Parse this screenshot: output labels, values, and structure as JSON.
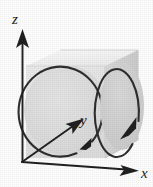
{
  "figure": {
    "title": "",
    "caption": "",
    "background_color": "#fefefe",
    "axes": {
      "z_label": "z",
      "y_label": "y",
      "x_label": "x",
      "axis_color": "#1c1c1c",
      "origin_label": ""
    },
    "box": {
      "front_face_color": "#e3e3e3",
      "top_face_color": "#f2f2f2",
      "right_face_color": "#d2d2d2",
      "edge_color": "#c9c9c9"
    },
    "curves": [
      {
        "name": "front-circle",
        "shape": "circle",
        "orientation": "counterclockwise-viewed-from-front",
        "arrow_direction": "down-left",
        "stroke_color": "#2a2a2a",
        "fill_color": "#dcdcdc"
      },
      {
        "name": "right-ellipse",
        "shape": "ellipse",
        "orientation": "clockwise-viewed-from-right",
        "arrow_direction": "down-left",
        "stroke_color": "#2a2a2a",
        "fill_color": "#cfcfcf"
      }
    ]
  }
}
